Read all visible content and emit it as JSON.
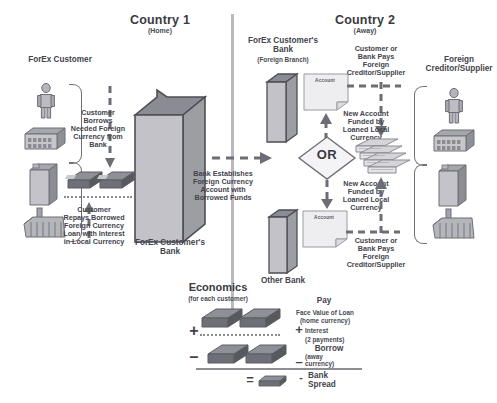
{
  "diagram": {
    "title_country1": "Country 1",
    "sub_country1": "(Home)",
    "title_country2": "Country 2",
    "sub_country2": "(Away)",
    "label_forex_customer": "ForEx Customer",
    "label_forex_bank": "ForEx Customer's\nBank",
    "label_forex_bank_foreign": "ForEx Customer's\nBank",
    "label_forex_bank_foreign_sub": "(Foreign Branch)",
    "label_foreign_creditor": "Foreign\nCreditor/Supplier",
    "label_other_bank": "Other Bank",
    "flow_customer_borrows": "Customer\nBorrows\nNeeded Foreign\nCurrency from\nBank",
    "flow_customer_repays": "Customer\nRepays Borrowed\nForeign Currency\nLoan with Interest\nin Local Currency",
    "flow_bank_establishes": "Bank Establishes\nForeign Currency\nAccount with\nBorrowed Funds",
    "flow_pays_creditor_top": "Customer or\nBank Pays\nForeign\nCreditor/Supplier",
    "flow_pays_creditor_bottom": "Customer or\nBank Pays\nForeign\nCreditor/Supplier",
    "flow_new_account_top": "New Account\nFunded by\nLoaned Local\nCurrency",
    "flow_new_account_bottom": "New Account\nFunded by\nLoaned Local\nCurrency",
    "or_label": "OR",
    "account_label_top": "Account",
    "account_label_bottom": "Account"
  },
  "economics": {
    "title": "Economics",
    "subtitle": "(for each customer)",
    "pay_label": "Pay",
    "pay_line1": "Face Value of Loan",
    "pay_line2": "(home currency)",
    "plus_sign": "+",
    "interest_label": "Interest",
    "interest_sub": "(2 payments)",
    "borrow_label": "Borrow",
    "borrow_sub": "(away\ncurrency)",
    "minus_sign": "–",
    "row_plus": "+",
    "row_minus": "–",
    "equals_sign": "=",
    "result_dash": "-",
    "result_label": "Bank\nSpread"
  },
  "icons": {
    "person": "person-icon",
    "low_building": "low-building-icon",
    "tower": "tower-building-icon",
    "factory": "factory-icon",
    "money": "money-stack-icon",
    "documents": "document-stack-icon",
    "account": "account-document-icon",
    "bank": "bank-building-icon",
    "or_diamond": "or-diamond-icon"
  },
  "colors": {
    "ink": "#3f3f45",
    "grey_dark": "#6d6d75",
    "grey_mid": "#9a9aa1",
    "grey_light": "#c9c9ce",
    "divider": "#b9b9be",
    "background": "#ffffff"
  }
}
